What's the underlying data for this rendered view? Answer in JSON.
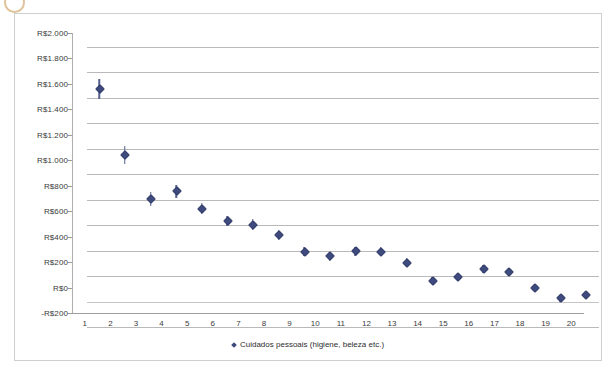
{
  "chart_data": {
    "type": "scatter",
    "title": "",
    "xlabel": "",
    "ylabel": "",
    "grid": true,
    "legend_position": "bottom",
    "currency_prefix": "R$",
    "x": [
      1,
      2,
      3,
      4,
      5,
      6,
      7,
      8,
      9,
      10,
      11,
      12,
      13,
      14,
      15,
      16,
      17,
      18,
      19,
      20
    ],
    "xticklabels": [
      "1",
      "2",
      "3",
      "4",
      "5",
      "6",
      "7",
      "8",
      "9",
      "10",
      "11",
      "12",
      "13",
      "14",
      "15",
      "16",
      "17",
      "18",
      "19",
      "20"
    ],
    "yticklabels": [
      "R$2.000",
      "R$1.800",
      "R$1.600",
      "R$1.400",
      "R$1.200",
      "R$1.000",
      "R$800",
      "R$600",
      "R$400",
      "R$200",
      "R$0",
      "-R$200"
    ],
    "ytickvalues": [
      2000,
      1800,
      1600,
      1400,
      1200,
      1000,
      800,
      600,
      400,
      200,
      0,
      -200
    ],
    "ylim": [
      -200,
      2000
    ],
    "xlim": [
      0.5,
      20.5
    ],
    "series": [
      {
        "name": "Cuidados pessoais (higiene, beleza etc.)",
        "color": "#3f4a7e",
        "marker": "diamond",
        "has_error_bars": true,
        "values": [
          1670,
          1150,
          805,
          865,
          730,
          630,
          605,
          520,
          390,
          355,
          395,
          390,
          305,
          165,
          190,
          255,
          230,
          110,
          25,
          50
        ],
        "errors": [
          75,
          70,
          55,
          50,
          45,
          40,
          40,
          40,
          35,
          35,
          35,
          35,
          35,
          30,
          30,
          30,
          30,
          30,
          30,
          8
        ]
      }
    ]
  },
  "legend": {
    "marker_name": "legend-diamond-marker",
    "label": "Cuidados pessoais (higiene, beleza etc.)"
  }
}
